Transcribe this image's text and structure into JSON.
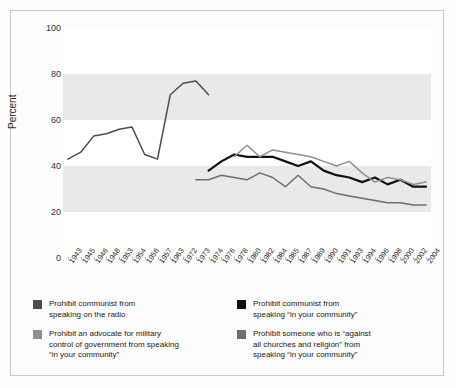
{
  "chart_data": {
    "type": "line",
    "title": "",
    "subtitle": "",
    "xlabel": "",
    "ylabel": "Percent",
    "ylim": [
      0,
      100
    ],
    "yticks": [
      0,
      20,
      40,
      60,
      80,
      100
    ],
    "grid": "alternating horizontal bands",
    "legend_position": "bottom",
    "categories": [
      "1943",
      "1945",
      "1946",
      "1948",
      "1953",
      "1954",
      "1956",
      "1957",
      "1963",
      "1972",
      "1973",
      "1974",
      "1976",
      "1978",
      "1980",
      "1982",
      "1984",
      "1985",
      "1987",
      "1989",
      "1990",
      "1991",
      "1993",
      "1994",
      "1996",
      "1998",
      "2000",
      "2002",
      "2004"
    ],
    "series": [
      {
        "name": "Prohibit communist from speaking on the radio",
        "color": "#4d4d4d",
        "values": [
          43,
          46,
          53,
          54,
          56,
          57,
          45,
          43,
          71,
          76,
          77,
          71,
          null,
          null,
          null,
          null,
          null,
          null,
          null,
          null,
          null,
          null,
          null,
          null,
          null,
          null,
          null,
          null,
          null
        ]
      },
      {
        "name": "Prohibit communist from speaking \"in your community\"",
        "color": "#111111",
        "values": [
          null,
          null,
          null,
          null,
          null,
          null,
          null,
          null,
          71,
          null,
          null,
          38,
          42,
          45,
          44,
          44,
          44,
          42,
          40,
          42,
          38,
          36,
          35,
          33,
          35,
          32,
          34,
          31,
          31
        ]
      },
      {
        "name": "Prohibit an advocate for military control of government from speaking \"in your community\"",
        "color": "#8f8f8f",
        "values": [
          null,
          null,
          null,
          null,
          null,
          null,
          null,
          null,
          null,
          null,
          null,
          null,
          null,
          44,
          49,
          44,
          47,
          46,
          45,
          44,
          42,
          40,
          42,
          37,
          33,
          35,
          34,
          32,
          33
        ]
      },
      {
        "name": "Prohibit someone who is \"against all churches and religion\" from speaking \"in your community\"",
        "color": "#6e6e6e",
        "values": [
          null,
          null,
          null,
          null,
          null,
          null,
          null,
          null,
          null,
          null,
          34,
          34,
          36,
          35,
          34,
          37,
          35,
          31,
          36,
          31,
          30,
          28,
          27,
          26,
          25,
          24,
          24,
          23,
          23
        ]
      }
    ]
  },
  "axis": {
    "ylabel": "Percent",
    "ytick_labels": [
      "100",
      "80",
      "60",
      "40",
      "20",
      "0"
    ]
  },
  "legend": {
    "items": [
      {
        "color": "#4d4d4d",
        "lines": [
          "Prohibit communist from",
          "speaking on the radio"
        ]
      },
      {
        "color": "#111111",
        "lines": [
          "Prohibit communist from",
          "speaking “in your community”"
        ]
      },
      {
        "color": "#8f8f8f",
        "lines": [
          "Prohibit an advocate for military",
          "control of government from speaking",
          "“in your community”"
        ]
      },
      {
        "color": "#6e6e6e",
        "lines": [
          "Prohibit someone who is “against",
          "all churches and religion” from",
          "speaking “in your community”"
        ]
      }
    ]
  }
}
